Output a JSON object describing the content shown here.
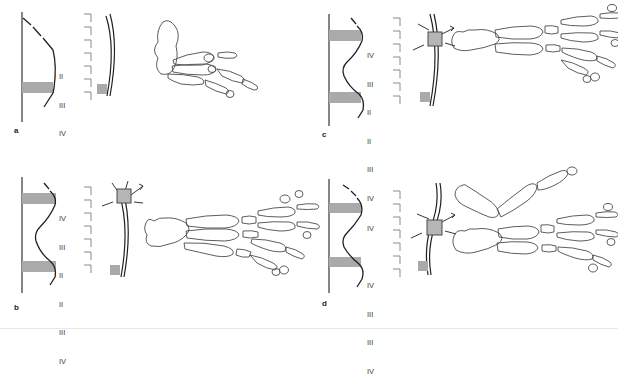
{
  "figure": {
    "background_color": "#ffffff",
    "line_color": "#231f20",
    "band_color": "#aaaaaa",
    "bead_color": "#b5b5b5",
    "numeral_color": "#3a3a3a",
    "width": 618,
    "height": 329
  },
  "panels": [
    {
      "id": "a",
      "letter": "a",
      "description": "Control limb bud: single gray band at posterior, triangular profile; no bead; resulting limb has reduced digits",
      "profile_type": "triangular",
      "band_count": 1,
      "bead_present": false,
      "numerals": [
        "II",
        "III",
        "IV"
      ],
      "bracket_count": 7,
      "skeleton_parts": 1
    },
    {
      "id": "b",
      "letter": "b",
      "description": "Two gray bands with bead implanted anteriorly; mirror-image duplication producing IV III II II III IV",
      "profile_type": "double-wave",
      "band_count": 2,
      "bead_present": true,
      "numerals": [
        "IV",
        "III",
        "II",
        "II",
        "III",
        "IV"
      ],
      "bracket_count": 7,
      "skeleton_parts": 1
    },
    {
      "id": "c",
      "letter": "c",
      "description": "Two gray bands with bead implanted mid-bud; duplication producing IV III II II III IV",
      "profile_type": "double-wave",
      "band_count": 2,
      "bead_present": true,
      "numerals": [
        "IV",
        "III",
        "II",
        "II",
        "III",
        "IV"
      ],
      "bracket_count": 7,
      "skeleton_parts": 1
    },
    {
      "id": "d",
      "letter": "d",
      "description": "Two gray bands with bead implanted posteriorly; separated limb elements producing IV and IV III III IV",
      "profile_type": "double-wave",
      "band_count": 2,
      "bead_present": true,
      "numerals": [
        "IV",
        "",
        "IV",
        "III",
        "III",
        "IV"
      ],
      "bracket_count": 7,
      "skeleton_parts": 2
    }
  ]
}
